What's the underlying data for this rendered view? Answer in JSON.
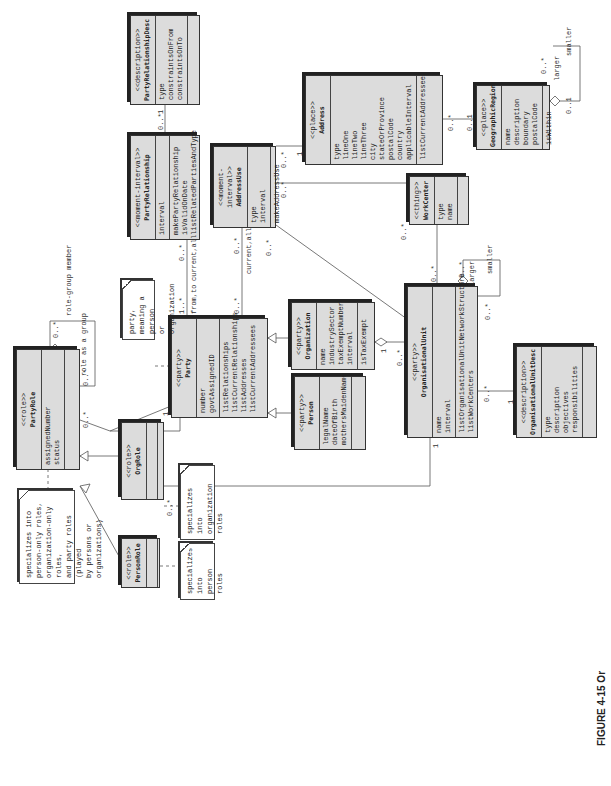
{
  "caption": "FIGURE 4-15 Or",
  "classes": {
    "party_relationship_desc": {
      "stereotype": "<<description>>",
      "name": "PartyRelationshipDesc",
      "attributes": [
        "type",
        "constraintsOnFrom",
        "constraintsOnTo"
      ],
      "methods": []
    },
    "party_relationship": {
      "stereotype": "<<moment-interval>>",
      "name": "PartyRelationship",
      "attributes": [
        "interval"
      ],
      "methods": [
        "makePartyRelationship",
        "isValidOnDate",
        "listRelatedPartiesAndType"
      ]
    },
    "address_use": {
      "stereotype": "<<moment-interval>>",
      "name": "AddressUse",
      "attributes": [
        "type",
        "interval"
      ],
      "methods": [
        "makeAddressUse"
      ]
    },
    "address": {
      "stereotype": "<<place>>",
      "name": "Address",
      "attributes": [
        "type",
        "lineOne",
        "lineTwo",
        "lineThree",
        "city",
        "stateOrProvince",
        "postalCode",
        "country",
        "applicableInterval"
      ],
      "methods": [
        "listCurrentAddressees"
      ]
    },
    "geographic_region": {
      "stereotype": "<<place>>",
      "name": "GeographicRegion",
      "attributes": [
        "name",
        "description",
        "boundary",
        "postalCode"
      ],
      "methods": [
        "isWithin"
      ]
    },
    "work_center": {
      "stereotype": "<<thing>>",
      "name": "WorkCenter",
      "attributes": [
        "type",
        "name"
      ],
      "methods": []
    },
    "party": {
      "stereotype": "<<party>>",
      "name": "Party",
      "attributes": [
        "number",
        "govtAssignedID"
      ],
      "methods": [
        "listRelationships",
        "listCurrentRelationships",
        "listAddresses",
        "listCurrentAddressees"
      ]
    },
    "organization": {
      "stereotype": "<<party>>",
      "name": "Organization",
      "attributes": [
        "name",
        "industrySector",
        "taxExemptNumber",
        "interval"
      ],
      "methods": [
        "isTaxExempt"
      ]
    },
    "person": {
      "stereotype": "<<party>>",
      "name": "Person",
      "attributes": [
        "legalName",
        "dateOfBirth",
        "mothersMaidenName"
      ],
      "methods": []
    },
    "organisational_unit": {
      "stereotype": "<<party>>",
      "name": "OrganisationalUnit",
      "attributes": [
        "name",
        "interval"
      ],
      "methods": [
        "listOrganisationalUnitNetworkStructure",
        "listWorkCenters"
      ]
    },
    "organisational_unit_desc": {
      "stereotype": "<<description>>",
      "name": "OrganisationalUnitDesc",
      "attributes": [
        "type",
        "description",
        "objectives",
        "responsibilities"
      ],
      "methods": []
    },
    "party_role": {
      "stereotype": "<<role>>",
      "name": "PartyRole",
      "attributes": [
        "assignedNumber",
        "status"
      ],
      "methods": []
    },
    "org_role": {
      "stereotype": "<<role>>",
      "name": "OrgRole",
      "attributes": [],
      "methods": []
    },
    "person_role": {
      "stereotype": "<<role>>",
      "name": "PersonRole",
      "attributes": [],
      "methods": []
    }
  },
  "notes": {
    "party_role_note": [
      "specializes into",
      "person-only roles,",
      "organization-only roles,",
      "and party roles (played",
      "by persons or organizations)"
    ],
    "party_note": [
      "party,",
      "meaning a person",
      "or organization"
    ],
    "org_role_note": [
      "specializes",
      "into organization",
      "roles"
    ],
    "person_role_note": [
      "specializes",
      "into person",
      "roles"
    ]
  },
  "labels": {
    "prd_many": "0..*",
    "prd_one": "1",
    "pr_many": "0..*",
    "pr_party_many": "1..*",
    "from_to": "from,to",
    "current_all_1": "current,all",
    "au_many": "0..*",
    "au_party_many": "0..*",
    "current_all_2": "current,all",
    "au_addr_one": "1",
    "au_addr_many": "0..*",
    "au_wc_many": "0..*",
    "au_ou_many": "0..*",
    "addr_geo_many": "0..*",
    "addr_geo_one": "0..1",
    "geo_larger": "larger",
    "geo_smaller": "smaller",
    "geo_many": "0..*",
    "geo_01": "0..1",
    "wc_many": "0..*",
    "ou_wc_many": "0..*",
    "ou_larger": "larger",
    "ou_smaller": "smaller",
    "ou_many1": "0..*",
    "ou_many2": "0..*",
    "org_ou_one": "1",
    "org_ou_many": "0..*",
    "ou_desc_many": "0..*",
    "ou_desc_one": "1",
    "role_group_member": "role-group member",
    "role_as_group": "role as a group",
    "pr_self_many1": "0..*",
    "pr_self_many2": "0..*",
    "party_role_many": "0..*",
    "party_role_one": "1",
    "orgrole_many": "0..*",
    "orgrole_ou_one": "1"
  }
}
